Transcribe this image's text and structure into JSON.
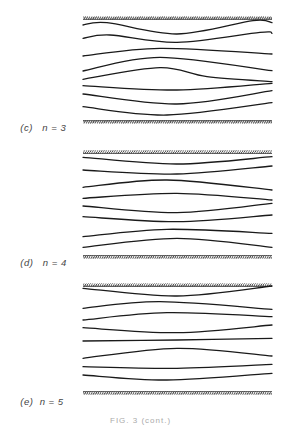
{
  "figure": {
    "panels": [
      {
        "id": "c",
        "label": "(c)",
        "mode": "n = 3",
        "label_y": 119,
        "walls": {
          "top": 18,
          "bottom": 122
        },
        "x_range": [
          83,
          272
        ],
        "streamlines": [
          [
            [
              83,
              25
            ],
            [
              107,
              22.7
            ],
            [
              177,
              34
            ],
            [
              253,
              20.7
            ],
            [
              272,
              22.7
            ]
          ],
          [
            [
              83,
              38.3
            ],
            [
              110,
              35
            ],
            [
              177,
              42.3
            ],
            [
              260,
              32.3
            ],
            [
              272,
              33.3
            ]
          ],
          [
            [
              83,
              56
            ],
            [
              160,
              48.3
            ],
            [
              272,
              54
            ]
          ],
          [
            [
              83,
              71
            ],
            [
              160,
              57.3
            ],
            [
              272,
              70.7
            ]
          ],
          [
            [
              83,
              79.3
            ],
            [
              160,
              67.7
            ],
            [
              207,
              76.7
            ],
            [
              272,
              81.7
            ]
          ],
          [
            [
              83,
              85.7
            ],
            [
              177,
              90
            ],
            [
              272,
              83.3
            ]
          ],
          [
            [
              83,
              94
            ],
            [
              177,
              104
            ],
            [
              272,
              90.7
            ]
          ],
          [
            [
              83,
              106.7
            ],
            [
              167,
              115
            ],
            [
              272,
              102.7
            ]
          ]
        ]
      },
      {
        "id": "d",
        "label": "(d)",
        "mode": "n = 4",
        "label_y": 254,
        "walls": {
          "top": 152,
          "bottom": 257
        },
        "x_range": [
          83,
          272
        ],
        "streamlines": [
          [
            [
              83,
              157.3
            ],
            [
              177,
              164
            ],
            [
              272,
              156.7
            ]
          ],
          [
            [
              83,
              170
            ],
            [
              177,
              174
            ],
            [
              272,
              166
            ]
          ],
          [
            [
              83,
              187.3
            ],
            [
              167,
              180
            ],
            [
              272,
              190
            ]
          ],
          [
            [
              83,
              198.3
            ],
            [
              177,
              193.3
            ],
            [
              272,
              200
            ]
          ],
          [
            [
              83,
              206
            ],
            [
              177,
              212.7
            ],
            [
              272,
              203.3
            ]
          ],
          [
            [
              83,
              216.7
            ],
            [
              177,
              221.7
            ],
            [
              272,
              215
            ]
          ],
          [
            [
              83,
              236.7
            ],
            [
              167,
              229.3
            ],
            [
              272,
              233.3
            ]
          ],
          [
            [
              83,
              247.3
            ],
            [
              177,
              238.3
            ],
            [
              272,
              247.3
            ]
          ]
        ]
      },
      {
        "id": "e",
        "label": "(e)",
        "mode": "n = 5",
        "label_y": 392,
        "walls": {
          "top": 285,
          "bottom": 393
        },
        "x_range": [
          83,
          272
        ],
        "streamlines": [
          [
            [
              83,
              288.3
            ],
            [
              177,
              296
            ],
            [
              272,
              286
            ]
          ],
          [
            [
              83,
              308.3
            ],
            [
              160,
              301.7
            ],
            [
              272,
              309.3
            ]
          ],
          [
            [
              83,
              320
            ],
            [
              167,
              312.7
            ],
            [
              272,
              316.7
            ]
          ],
          [
            [
              83,
              327.7
            ],
            [
              177,
              332.7
            ],
            [
              272,
              325
            ]
          ],
          [
            [
              83,
              341
            ],
            [
              177,
              340
            ],
            [
              272,
              338.3
            ]
          ],
          [
            [
              83,
              358.3
            ],
            [
              177,
              348.3
            ],
            [
              272,
              356
            ]
          ],
          [
            [
              83,
              366.7
            ],
            [
              177,
              368.3
            ],
            [
              272,
              364.3
            ]
          ],
          [
            [
              83,
              375
            ],
            [
              167,
              380
            ],
            [
              272,
              373.3
            ]
          ]
        ]
      }
    ],
    "caption": "FIG. 3 (cont.)",
    "colors": {
      "line": "#1a1a1a",
      "wall": "#333333",
      "label": "#444444"
    }
  }
}
